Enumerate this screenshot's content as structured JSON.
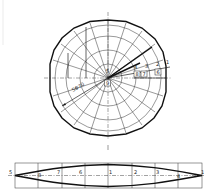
{
  "drawing": {
    "top_view": {
      "center_label": "5",
      "center_box_label": "9",
      "dimension_label": "SΦ70",
      "radial_labels": [
        "4",
        "3",
        "2",
        "1"
      ],
      "boxed_labels": [
        "8",
        "7",
        "6"
      ]
    },
    "development_strip": {
      "labels": [
        "5",
        "8",
        "7",
        "6",
        "1",
        "2",
        "3",
        "4",
        "1"
      ],
      "top_tick": "1"
    }
  }
}
